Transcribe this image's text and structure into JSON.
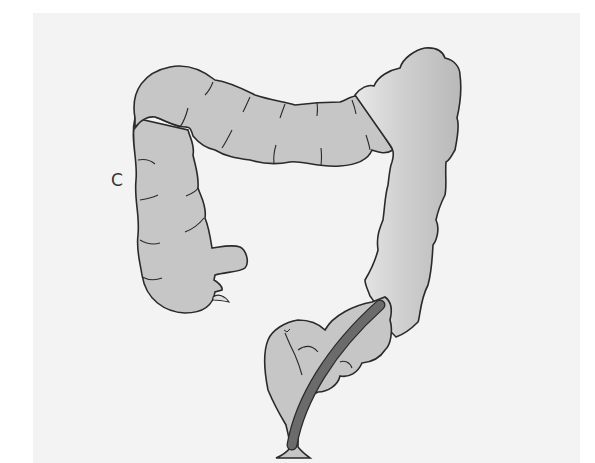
{
  "figure": {
    "panel_label": "C",
    "colors": {
      "background": "#f3f3f3",
      "colon_fill": "#c4c4c4",
      "colon_highlight": "#e6e6e6",
      "outline": "#2a2a2a",
      "tube": "#6b6b6b"
    },
    "parts": [
      "ascending-colon",
      "transverse-colon",
      "descending-colon",
      "sigmoid-colon",
      "rectum",
      "appendix",
      "terminal-ileum",
      "instrument-tube"
    ]
  }
}
